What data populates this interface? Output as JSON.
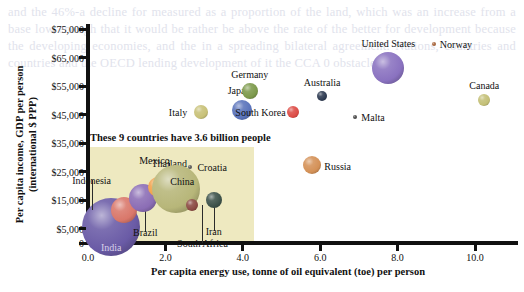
{
  "background_text": "and the 46%-a decline for measured as a proportion of the land, which was an increase from a base low enough that it would be rather be above the rate of the better for development because the developing economies, and the in a spreading bilateral agreement. Nations, countries and countries and the OECD lending development of it the CCA 0 obstacles",
  "chart_data": {
    "type": "scatter",
    "title": "",
    "xlabel": "Per capita energy use, tonne of oil equivalent (toe) per person",
    "ylabel": "Per capita income, GDP per person\n(international $ PPP)",
    "ylabel_line1": "Per capita income, GDP per person",
    "ylabel_line2": "(international $ PPP)",
    "xlim": [
      0.0,
      11.15
    ],
    "ylim": [
      0,
      78000
    ],
    "xticks": [
      "0.0",
      "2.0",
      "4.0",
      "6.0",
      "8.0",
      "10.0"
    ],
    "xtick_values": [
      0,
      2,
      4,
      6,
      8,
      10
    ],
    "yticks": [
      "0",
      "$5,000",
      "$15,000",
      "$25,000",
      "$35,000",
      "$45,000",
      "$55,000",
      "$65,000",
      "$75,000"
    ],
    "ytick_values": [
      0,
      5000,
      15000,
      25000,
      35000,
      45000,
      55000,
      65000,
      75000
    ],
    "grid": false,
    "legend": "none",
    "size_encodes": "population",
    "annotation": {
      "text": "These 9 countries have 3.6 billion people",
      "highlight_color": "#eee9c0",
      "x_range": [
        0.0,
        4.3
      ],
      "y_range": [
        0,
        33500
      ]
    },
    "points": [
      {
        "name": "India",
        "x": 0.6,
        "y": 5700,
        "r": 29,
        "color": "#6a5ba6",
        "label_dx": 0,
        "label_dy": 20,
        "leader": false,
        "label_color": "#d8d2ea"
      },
      {
        "name": "Indonesia",
        "x": 0.92,
        "y": 11500,
        "r": 13,
        "color": "#d9776a",
        "label_dx": -32,
        "label_dy": -30,
        "leader": true
      },
      {
        "name": "Brazil",
        "x": 1.43,
        "y": 15800,
        "r": 14,
        "color": "#8b6db5",
        "label_dx": 2,
        "label_dy": 34,
        "leader": true
      },
      {
        "name": "Mexico",
        "x": 1.82,
        "y": 19500,
        "r": 10,
        "color": "#f2a24b",
        "label_dx": -4,
        "label_dy": -27,
        "leader": false
      },
      {
        "name": "Thailand",
        "x": 2.02,
        "y": 17000,
        "r": 7,
        "color": "#b86a46",
        "label_dx": 3,
        "label_dy": -32,
        "leader": true
      },
      {
        "name": "China",
        "x": 2.28,
        "y": 19000,
        "r": 24,
        "color": "#b7b679",
        "label_dx": 6,
        "label_dy": -8,
        "leader": false
      },
      {
        "name": "Croatia",
        "x": 2.64,
        "y": 26800,
        "r": 2,
        "color": "#5a5a5a",
        "label_dx": 22,
        "label_dy": 0,
        "leader": false
      },
      {
        "name": "South Africa",
        "x": 2.7,
        "y": 13200,
        "r": 6,
        "color": "#8b4a42",
        "label_dx": 10,
        "label_dy": 38,
        "leader": true
      },
      {
        "name": "Iran",
        "x": 3.25,
        "y": 15200,
        "r": 8,
        "color": "#3d524a",
        "label_dx": 0,
        "label_dy": 31,
        "leader": true
      },
      {
        "name": "Italy",
        "x": 2.92,
        "y": 45800,
        "r": 7,
        "color": "#c8c178",
        "label_dx": -23,
        "label_dy": 0,
        "leader": false
      },
      {
        "name": "Japan",
        "x": 3.98,
        "y": 46800,
        "r": 10,
        "color": "#5a73bb",
        "label_dx": -3,
        "label_dy": -20,
        "leader": false
      },
      {
        "name": "Germany",
        "x": 4.18,
        "y": 53200,
        "r": 8,
        "color": "#7d9a4c",
        "label_dx": 0,
        "label_dy": -17,
        "leader": false
      },
      {
        "name": "South Korea",
        "x": 5.31,
        "y": 45800,
        "r": 6,
        "color": "#dd4c46",
        "label_dx": -33,
        "label_dy": 0,
        "leader": false
      },
      {
        "name": "Russia",
        "x": 5.78,
        "y": 27200,
        "r": 9,
        "color": "#d49157",
        "label_dx": 26,
        "label_dy": 1,
        "leader": false
      },
      {
        "name": "Australia",
        "x": 6.05,
        "y": 51500,
        "r": 5,
        "color": "#2e3b52",
        "label_dx": 0,
        "label_dy": -14,
        "leader": false
      },
      {
        "name": "Malta",
        "x": 6.9,
        "y": 44200,
        "r": 2,
        "color": "#4a4a4a",
        "label_dx": 18,
        "label_dy": 0,
        "leader": false
      },
      {
        "name": "United States",
        "x": 7.76,
        "y": 61500,
        "r": 16,
        "color": "#8a72c0",
        "label_dx": 0,
        "label_dy": -25,
        "leader": false
      },
      {
        "name": "Norway",
        "x": 8.94,
        "y": 69900,
        "r": 2,
        "color": "#a8653c",
        "label_dx": 22,
        "label_dy": 0,
        "leader": false
      },
      {
        "name": "Canada",
        "x": 10.24,
        "y": 50200,
        "r": 6,
        "color": "#c4c077",
        "label_dx": 0,
        "label_dy": -15,
        "leader": false
      }
    ]
  }
}
